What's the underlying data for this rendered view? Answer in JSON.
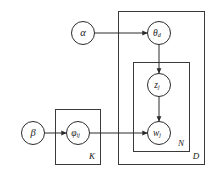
{
  "diagram": {
    "canvas": {
      "width": 214,
      "height": 178,
      "background": "#ffffff"
    },
    "stroke_color": "#2b2b2b",
    "plate_stroke_color": "#3a3a3a",
    "node_fill": "#ffffff",
    "nodes": [
      {
        "id": "alpha",
        "label": "α",
        "subscript": "",
        "cx": 83,
        "cy": 33,
        "r": 11.5,
        "observed": false
      },
      {
        "id": "theta",
        "label": "θ",
        "subscript": "d",
        "cx": 159,
        "cy": 33,
        "r": 11.5,
        "observed": false
      },
      {
        "id": "z",
        "label": "z",
        "subscript": "j",
        "cx": 159,
        "cy": 85,
        "r": 11.5,
        "observed": false
      },
      {
        "id": "w",
        "label": "w",
        "subscript": "j",
        "cx": 159,
        "cy": 133,
        "r": 11.5,
        "observed": false
      },
      {
        "id": "beta",
        "label": "β",
        "subscript": "",
        "cx": 33,
        "cy": 133,
        "r": 11.5,
        "observed": false
      },
      {
        "id": "phi",
        "label": "φ",
        "subscript": "ij",
        "cx": 78,
        "cy": 133,
        "r": 11.5,
        "observed": false
      }
    ],
    "plates": [
      {
        "id": "plate-d",
        "label": "D",
        "x": 118,
        "y": 11,
        "width": 87,
        "height": 154,
        "label_x": 196,
        "label_y": 157
      },
      {
        "id": "plate-n",
        "label": "N",
        "x": 133,
        "y": 62,
        "width": 57,
        "height": 90,
        "label_x": 181,
        "label_y": 144
      },
      {
        "id": "plate-k",
        "label": "K",
        "x": 55,
        "y": 109,
        "width": 46,
        "height": 56,
        "label_x": 92,
        "label_y": 157
      }
    ],
    "edges": [
      {
        "id": "alpha-to-theta",
        "from": "alpha",
        "to": "theta",
        "direction": "horizontal"
      },
      {
        "id": "theta-to-z",
        "from": "theta",
        "to": "z",
        "direction": "vertical"
      },
      {
        "id": "z-to-w",
        "from": "z",
        "to": "w",
        "direction": "vertical"
      },
      {
        "id": "beta-to-phi",
        "from": "beta",
        "to": "phi",
        "direction": "horizontal"
      },
      {
        "id": "phi-to-w",
        "from": "phi",
        "to": "w",
        "direction": "horizontal"
      }
    ]
  }
}
